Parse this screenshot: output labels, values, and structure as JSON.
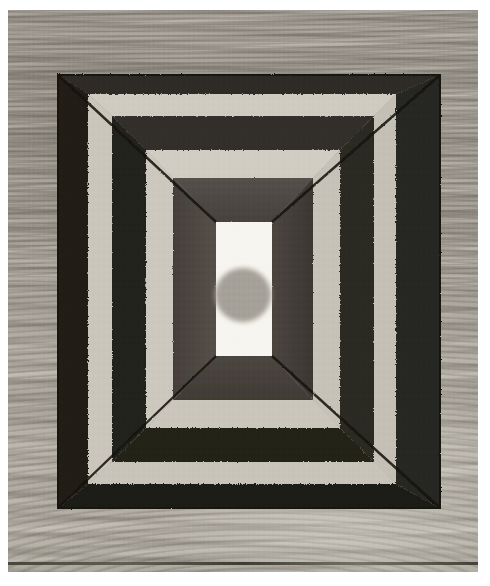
{
  "artwork": {
    "title": "One-point perspective tunnel box drawing",
    "medium_surface": "wood panel photograph",
    "photo_border_color": "#ffffff",
    "background": {
      "name": "wood-grain-panel",
      "base_color": "#aba69d",
      "grain_dark": "#5a544c",
      "grain_light": "#d8d3c8",
      "bottom_edge_color": "#3a352e"
    },
    "palette": {
      "dark_charcoal": "#2b2823",
      "mid_charcoal": "#4e4943",
      "warm_dark": "#3e3a33",
      "light_panel": "#cfcac0",
      "pale_panel": "#d8d3c9",
      "center_white": "#f7f5ef",
      "center_circle_gray": "#a5a098",
      "frame_outline": "#1d1b18"
    },
    "geometry": {
      "photo_x": 8,
      "photo_y": 10,
      "photo_width": 470,
      "photo_height": 562,
      "outer_frame": {
        "left": 50,
        "top": 65,
        "right": 432,
        "bottom": 498
      },
      "center_panel": {
        "left": 208,
        "top": 212,
        "right": 264,
        "bottom": 346
      },
      "center_circle": {
        "cx": 235,
        "cy": 285,
        "r": 28
      }
    },
    "layers": [
      {
        "name": "outer-dark-band",
        "tone": "dark",
        "color": "#2b2823"
      },
      {
        "name": "first-light-band",
        "tone": "light",
        "color": "#cfcac0"
      },
      {
        "name": "second-dark-band",
        "tone": "dark",
        "color": "#2e2b26"
      },
      {
        "name": "second-light-band",
        "tone": "light",
        "color": "#d2cdc3"
      },
      {
        "name": "inner-mid-band",
        "tone": "mid",
        "color": "#4e4943"
      },
      {
        "name": "center-white-panel",
        "tone": "white",
        "color": "#f7f5ef"
      },
      {
        "name": "center-circle",
        "tone": "gray",
        "color": "#a5a098"
      }
    ],
    "perspective_lines": {
      "count": 4,
      "description": "diagonal orthogonals from the four outer corners converging toward the center panel"
    }
  }
}
